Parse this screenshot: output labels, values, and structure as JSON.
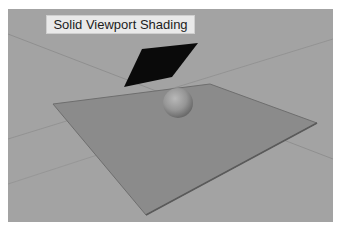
{
  "viewport": {
    "label": "Solid Viewport Shading",
    "background_color": "#a3a3a3",
    "objects": [
      {
        "name": "ground-plane",
        "color": "#8b8b8b"
      },
      {
        "name": "dark-card",
        "color": "#0a0a0a"
      },
      {
        "name": "sphere",
        "color": "#9a9a9a"
      }
    ]
  }
}
